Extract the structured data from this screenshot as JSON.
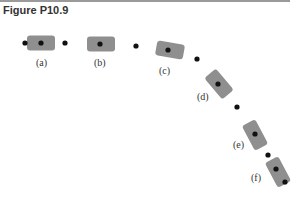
{
  "figure": {
    "title": "Figure P10.9",
    "car_color": "#8f8f8f",
    "dot_color": "#111111",
    "cars": [
      {
        "label": "(a)",
        "cx": 41,
        "cy": 43,
        "angle": 0,
        "lx": 36,
        "ly": 66
      },
      {
        "label": "(b)",
        "cx": 101,
        "cy": 44,
        "angle": 0,
        "lx": 94,
        "ly": 66
      },
      {
        "label": "(c)",
        "cx": 170,
        "cy": 50,
        "angle": 10,
        "lx": 159,
        "ly": 74
      },
      {
        "label": "(d)",
        "cx": 219,
        "cy": 84,
        "angle": 50,
        "lx": 197,
        "ly": 100
      },
      {
        "label": "(e)",
        "cx": 255,
        "cy": 135,
        "angle": 62,
        "lx": 233,
        "ly": 148
      },
      {
        "label": "(f)",
        "cx": 278,
        "cy": 172,
        "angle": 62,
        "lx": 251,
        "ly": 181
      }
    ],
    "dots": [
      [
        25,
        43
      ],
      [
        41,
        43
      ],
      [
        65,
        43
      ],
      [
        100,
        44
      ],
      [
        136,
        46
      ],
      [
        168,
        50
      ],
      [
        197,
        59
      ],
      [
        218,
        84
      ],
      [
        237,
        107
      ],
      [
        255,
        134
      ],
      [
        268,
        155
      ],
      [
        276,
        169
      ],
      [
        285,
        182
      ]
    ]
  }
}
